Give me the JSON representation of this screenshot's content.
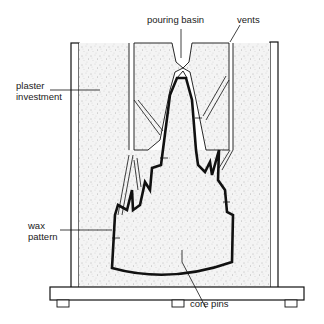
{
  "diagram": {
    "labels": {
      "pouring_basin": "pouring basin",
      "vents": "vents",
      "plaster_line1": "plaster",
      "plaster_line2": "investment",
      "wax_line1": "wax",
      "wax_line2": "pattern",
      "core_pins": "core pins"
    },
    "colors": {
      "ink": "#111111",
      "plaster_fill": "#f2f2f2",
      "stipple": "#8a8a8a",
      "background": "#ffffff"
    }
  }
}
